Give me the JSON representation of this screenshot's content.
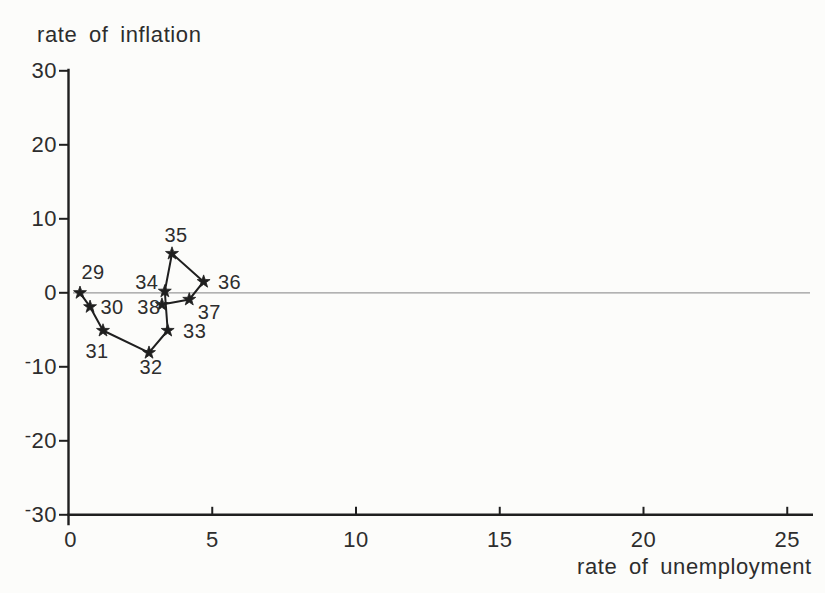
{
  "colors": {
    "background": "#fcfcfa",
    "ink": "#1f1f1f",
    "text": "#2d2d2d",
    "zero_line": "#9a9a9a"
  },
  "chart_data": {
    "type": "scatter",
    "subtype": "connected-scatter-time-path",
    "title": "",
    "ylabel": "rate of inflation",
    "xlabel": "rate of unemployment",
    "xlim": [
      0,
      25.9
    ],
    "ylim": [
      -30,
      30
    ],
    "x_ticks": [
      0,
      5,
      10,
      15,
      20,
      25
    ],
    "y_ticks": [
      30,
      20,
      10,
      0,
      -10,
      -20,
      -30
    ],
    "grid": false,
    "legend": "none",
    "zero_line_y": 0,
    "marker": "star",
    "points": [
      {
        "label": "29",
        "x": 0.4,
        "y": 0.0,
        "label_dx": 13,
        "label_dy": -21
      },
      {
        "label": "30",
        "x": 0.75,
        "y": -1.9,
        "label_dx": 22,
        "label_dy": 0
      },
      {
        "label": "31",
        "x": 1.2,
        "y": -5.1,
        "label_dx": -6,
        "label_dy": 20
      },
      {
        "label": "32",
        "x": 2.8,
        "y": -8.1,
        "label_dx": 2,
        "label_dy": 14
      },
      {
        "label": "33",
        "x": 3.45,
        "y": -5.1,
        "label_dx": 27,
        "label_dy": 0
      },
      {
        "label": "34",
        "x": 3.35,
        "y": 0.2,
        "label_dx": -18,
        "label_dy": -9
      },
      {
        "label": "35",
        "x": 3.6,
        "y": 5.3,
        "label_dx": 4,
        "label_dy": -19
      },
      {
        "label": "36",
        "x": 4.7,
        "y": 1.5,
        "label_dx": 26,
        "label_dy": 0
      },
      {
        "label": "37",
        "x": 4.2,
        "y": -0.9,
        "label_dx": 20,
        "label_dy": 13
      },
      {
        "label": "38",
        "x": 3.25,
        "y": -1.6,
        "label_dx": -13,
        "label_dy": 2
      }
    ]
  }
}
